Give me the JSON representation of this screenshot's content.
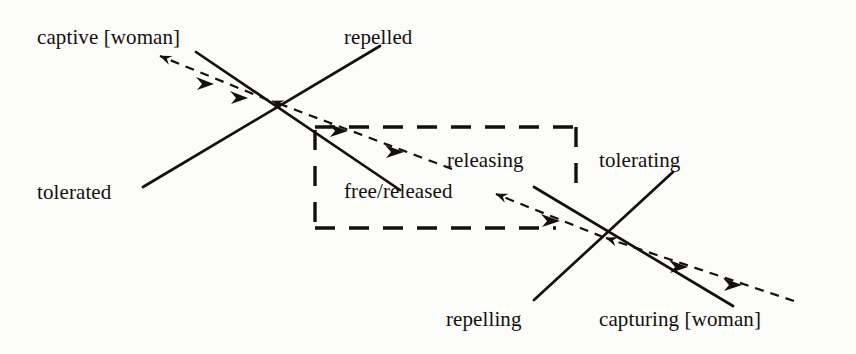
{
  "figure": {
    "kind": "actantial-square-diagram",
    "ink_color": "#15100c",
    "paper_color": "#fcfcfa",
    "labels": {
      "captive": "captive [woman]",
      "repelled": "repelled",
      "tolerated": "tolerated",
      "releasing": "releasing",
      "tolerating": "tolerating",
      "free_released": "free/released",
      "repelling": "repelling",
      "capturing": "capturing [woman]"
    },
    "label_positions": [
      {
        "name": "captive-woman",
        "x": 37,
        "y": 27,
        "align": "left"
      },
      {
        "name": "repelled",
        "x": 344,
        "y": 27,
        "align": "left"
      },
      {
        "name": "tolerated",
        "x": 37,
        "y": 182,
        "align": "left"
      },
      {
        "name": "releasing",
        "x": 447,
        "y": 150,
        "align": "left"
      },
      {
        "name": "tolerating",
        "x": 599,
        "y": 150,
        "align": "left"
      },
      {
        "name": "free-released",
        "x": 344,
        "y": 181,
        "align": "left"
      },
      {
        "name": "repelling",
        "x": 446,
        "y": 309,
        "align": "left"
      },
      {
        "name": "capturing-woman",
        "x": 599,
        "y": 309,
        "align": "left"
      }
    ],
    "crossings": [
      {
        "name": "upper-crossing",
        "x": 265,
        "y": 98
      },
      {
        "name": "lower-crossing",
        "x": 600,
        "y": 235
      }
    ],
    "solid_lines": [
      {
        "name": "captive-to-free-axis",
        "x1": 196,
        "y1": 52,
        "x2": 400,
        "y2": 190
      },
      {
        "name": "tolerated-to-repelled-axis",
        "x1": 143,
        "y1": 187,
        "x2": 380,
        "y2": 46
      },
      {
        "name": "releasing-to-capturing-axis",
        "x1": 534,
        "y1": 187,
        "x2": 733,
        "y2": 306
      },
      {
        "name": "repelling-to-tolerating-axis",
        "x1": 534,
        "y1": 300,
        "x2": 673,
        "y2": 172
      }
    ],
    "dashed_arrows": [
      {
        "name": "arrow-upper-left",
        "x1": 265,
        "y1": 98,
        "x2": 157,
        "y2": 54,
        "heads": 3
      },
      {
        "name": "arrow-upper-to-lower-span",
        "x1": 455,
        "y1": 170,
        "x2": 266,
        "y2": 98,
        "heads": 3
      },
      {
        "name": "arrow-lower-left",
        "x1": 600,
        "y1": 235,
        "x2": 492,
        "y2": 192,
        "heads": 2
      },
      {
        "name": "arrow-lower-right-tail",
        "x1": 792,
        "y1": 300,
        "x2": 600,
        "y2": 235,
        "heads": 3
      }
    ],
    "dashed_box": {
      "name": "central-terms-box",
      "x": 315,
      "y": 127,
      "width": 261,
      "height": 101
    }
  }
}
